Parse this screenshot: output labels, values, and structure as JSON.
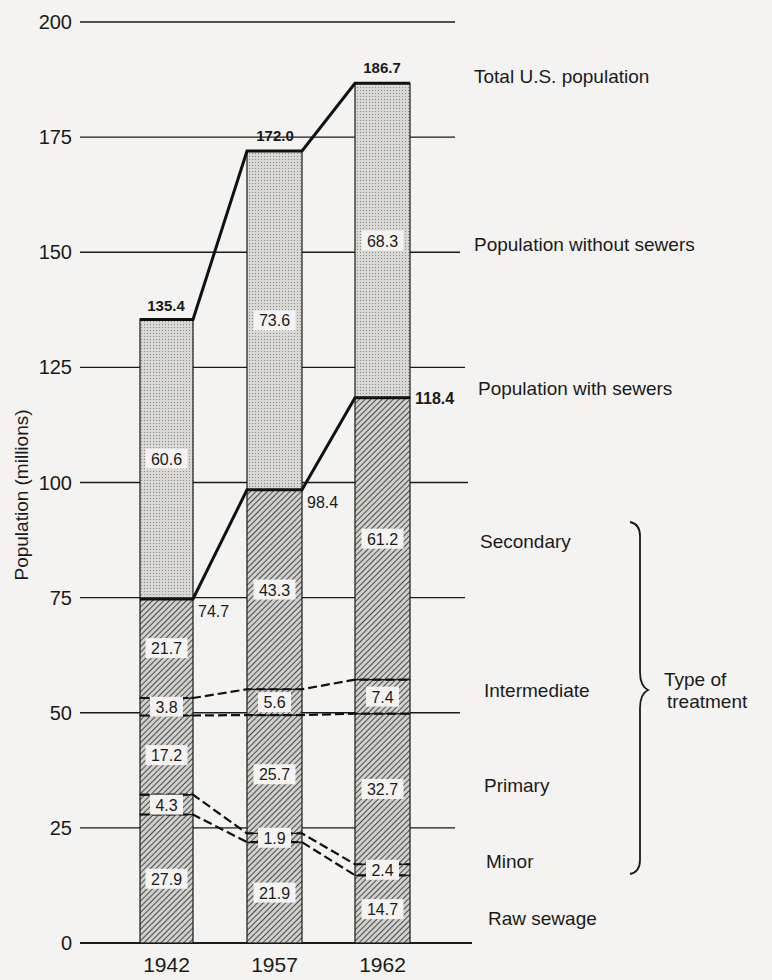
{
  "chart_data": {
    "type": "bar",
    "subtype": "stacked",
    "title": "",
    "xlabel": "",
    "ylabel": "Population (millions)",
    "ylim": [
      0,
      200
    ],
    "yticks": [
      0,
      25,
      50,
      75,
      100,
      125,
      150,
      175,
      200
    ],
    "grid": true,
    "categories": [
      "1942",
      "1957",
      "1962"
    ],
    "series": [
      {
        "name": "Raw sewage",
        "values": [
          27.9,
          21.9,
          14.7
        ]
      },
      {
        "name": "Minor",
        "values": [
          4.3,
          1.9,
          2.4
        ]
      },
      {
        "name": "Primary",
        "values": [
          17.2,
          25.7,
          32.7
        ]
      },
      {
        "name": "Intermediate",
        "values": [
          3.8,
          5.6,
          7.4
        ]
      },
      {
        "name": "Secondary",
        "values": [
          21.7,
          43.3,
          61.2
        ]
      },
      {
        "name": "Population without sewers",
        "values": [
          60.6,
          73.6,
          68.3
        ]
      }
    ],
    "totals": {
      "Population with sewers": [
        74.7,
        98.4,
        118.4
      ],
      "Total U.S. population": [
        135.4,
        172.0,
        186.7
      ]
    },
    "total_labels": [
      "135.4",
      "172.0",
      "186.7"
    ],
    "sewer_labels": [
      "74.7",
      "98.4",
      "118.4"
    ],
    "segment_labels": [
      [
        "27.9",
        "4.3",
        "17.2",
        "3.8",
        "21.7",
        "60.6"
      ],
      [
        "21.9",
        "1.9",
        "25.7",
        "5.6",
        "43.3",
        "73.6"
      ],
      [
        "14.7",
        "2.4",
        "32.7",
        "7.4",
        "61.2",
        "68.3"
      ]
    ],
    "legend": {
      "position": "right",
      "entries": [
        "Total U.S. population",
        "Population without sewers",
        "Population with sewers",
        "Secondary",
        "Intermediate",
        "Primary",
        "Minor",
        "Raw sewage"
      ],
      "brace_label": "Type of treatment"
    }
  },
  "axis": {
    "ylabel": "Population (millions)",
    "ticks": [
      "0",
      "25",
      "50",
      "75",
      "100",
      "125",
      "150",
      "175",
      "200"
    ],
    "xticks": [
      "1942",
      "1957",
      "1962"
    ]
  },
  "legend": {
    "total": "Total U.S. population",
    "without": "Population without sewers",
    "with": "Population with sewers",
    "secondary": "Secondary",
    "intermediate": "Intermediate",
    "primary": "Primary",
    "minor": "Minor",
    "raw": "Raw sewage",
    "brace_line1": "Type of",
    "brace_line2": "treatment"
  }
}
